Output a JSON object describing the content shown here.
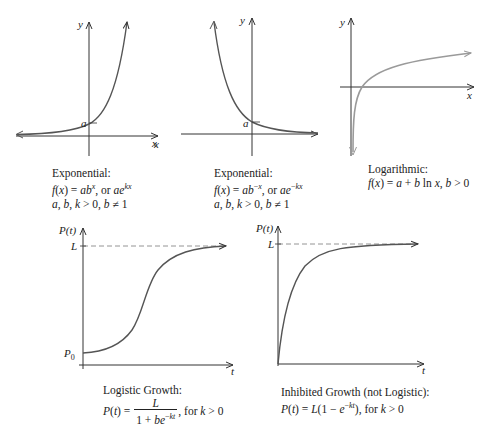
{
  "graphs": [
    {
      "id": "exp-growth",
      "title": "Exponential:",
      "formula": "f(x) = ab^x, or ae^kx",
      "conditions": "a, b, k > 0, b ≠ 1",
      "axis_labels": {
        "x": "x",
        "y": "y"
      },
      "marker": "a"
    },
    {
      "id": "exp-decay",
      "title": "Exponential:",
      "formula": "f(x) = ab^-x, or ae^-kx",
      "conditions": "a, b, k > 0, b ≠ 1",
      "axis_labels": {
        "x": "x",
        "y": "y"
      },
      "marker": "a"
    },
    {
      "id": "logarithmic",
      "title": "Logarithmic:",
      "formula": "f(x) = a + b ln x, b > 0",
      "axis_labels": {
        "x": "x",
        "y": "y"
      }
    },
    {
      "id": "logistic",
      "title": "Logistic Growth:",
      "formula": "P(t) = L / (1 + be^-kt), for k > 0",
      "axis_labels": {
        "x": "t",
        "y": "P(t)"
      },
      "markers": {
        "limit": "L",
        "initial": "P0"
      }
    },
    {
      "id": "inhibited",
      "title": "Inhibited Growth (not Logistic):",
      "formula": "P(t) = L(1 − e^-kt), for k > 0",
      "axis_labels": {
        "x": "t",
        "y": "P(t)"
      },
      "markers": {
        "limit": "L"
      }
    }
  ],
  "labels": {
    "g1_title": "Exponential:",
    "g1_cond": "a, b, k > 0, b ≠ 1",
    "g2_title": "Exponential:",
    "g2_cond": "a, b, k > 0, b ≠ 1",
    "g3_title": "Logarithmic:",
    "g4_title": "Logistic Growth:",
    "g5_title": "Inhibited Growth (not Logistic):",
    "x": "x",
    "y": "y",
    "t": "t",
    "Pt": "P(t)",
    "a": "a",
    "L": "L",
    "P": "P",
    "zero": "0",
    "for_k": ", for k > 0"
  },
  "colors": {
    "axis": "#333333",
    "curve": "#555555",
    "log_curve": "#9a9a9a",
    "dashed": "#888888"
  }
}
